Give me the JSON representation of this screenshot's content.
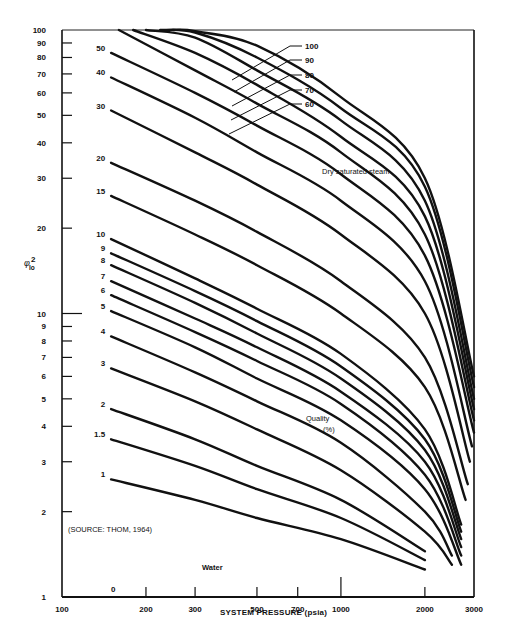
{
  "chart_data": {
    "type": "line",
    "title": "",
    "xlabel": "SYSTEM PRESSURE (psia)",
    "ylabel": "φ²_lo",
    "xscale": "log",
    "yscale": "log",
    "xlim": [
      100,
      3000
    ],
    "ylim": [
      1,
      100
    ],
    "grid": false,
    "x_ticks": [
      100,
      200,
      300,
      500,
      700,
      1000,
      2000,
      3000
    ],
    "x_tick_labels": [
      "100",
      "200",
      "300",
      "500",
      "700",
      "1000",
      "2000",
      "3000"
    ],
    "y_ticks": [
      1,
      2,
      3,
      4,
      5,
      6,
      7,
      8,
      9,
      10,
      20,
      30,
      40,
      50,
      60,
      70,
      80,
      90,
      100
    ],
    "y_tick_labels": [
      "1",
      "2",
      "3",
      "4",
      "5",
      "6",
      "7",
      "8",
      "9",
      "10",
      "20",
      "30",
      "40",
      "50",
      "60",
      "70",
      "80",
      "90",
      "100"
    ],
    "legend_title": "Quality (%)",
    "series": [
      {
        "name": "0",
        "x": [
          150,
          3000
        ],
        "y": [
          1,
          1
        ]
      },
      {
        "name": "1",
        "x": [
          150,
          300,
          500,
          1000,
          2000
        ],
        "y": [
          2.6,
          2.2,
          1.9,
          1.6,
          1.25
        ]
      },
      {
        "name": "1.5",
        "x": [
          150,
          300,
          500,
          1000,
          2000
        ],
        "y": [
          3.6,
          2.9,
          2.4,
          1.9,
          1.35
        ]
      },
      {
        "name": "2",
        "x": [
          150,
          300,
          500,
          1000,
          2000
        ],
        "y": [
          4.6,
          3.6,
          2.9,
          2.2,
          1.45
        ]
      },
      {
        "name": "3",
        "x": [
          150,
          300,
          500,
          1000,
          2000,
          2500
        ],
        "y": [
          6.4,
          4.9,
          3.9,
          2.8,
          1.7,
          1.3
        ]
      },
      {
        "name": "4",
        "x": [
          150,
          300,
          500,
          1000,
          2000,
          2500
        ],
        "y": [
          8.3,
          6.2,
          4.9,
          3.5,
          2.0,
          1.4
        ]
      },
      {
        "name": "5",
        "x": [
          150,
          300,
          500,
          1000,
          2000,
          2700
        ],
        "y": [
          10.2,
          7.6,
          5.9,
          4.2,
          2.4,
          1.3
        ]
      },
      {
        "name": "6",
        "x": [
          150,
          300,
          500,
          1000,
          2000,
          2700
        ],
        "y": [
          11.6,
          8.6,
          6.8,
          4.8,
          2.7,
          1.4
        ]
      },
      {
        "name": "7",
        "x": [
          150,
          300,
          500,
          1000,
          2000,
          2700
        ],
        "y": [
          13.0,
          9.6,
          7.6,
          5.3,
          3.0,
          1.5
        ]
      },
      {
        "name": "8",
        "x": [
          150,
          300,
          500,
          1000,
          2000,
          2700
        ],
        "y": [
          14.8,
          10.9,
          8.5,
          5.9,
          3.3,
          1.6
        ]
      },
      {
        "name": "9",
        "x": [
          150,
          300,
          500,
          1000,
          2000,
          2700
        ],
        "y": [
          16.3,
          12.0,
          9.4,
          6.5,
          3.6,
          1.7
        ]
      },
      {
        "name": "10",
        "x": [
          150,
          300,
          500,
          1000,
          2000,
          2700
        ],
        "y": [
          18.3,
          13.3,
          10.4,
          7.2,
          3.9,
          1.8
        ]
      },
      {
        "name": "15",
        "x": [
          150,
          300,
          500,
          1000,
          2000,
          2800
        ],
        "y": [
          26,
          19,
          14.8,
          10,
          5.5,
          2.2
        ]
      },
      {
        "name": "20",
        "x": [
          150,
          300,
          500,
          1000,
          2000,
          2850
        ],
        "y": [
          34,
          25,
          19.4,
          13,
          7,
          2.5
        ]
      },
      {
        "name": "30",
        "x": [
          150,
          300,
          500,
          1000,
          2000,
          2900
        ],
        "y": [
          52,
          37,
          28.5,
          19,
          10,
          3.0
        ]
      },
      {
        "name": "40",
        "x": [
          150,
          300,
          500,
          1000,
          2000,
          2950
        ],
        "y": [
          68,
          49,
          37,
          25,
          13,
          3.4
        ]
      },
      {
        "name": "50",
        "x": [
          150,
          300,
          500,
          1000,
          2000,
          3000
        ],
        "y": [
          83,
          60,
          46,
          31,
          16,
          3.8
        ]
      },
      {
        "name": "60",
        "x": [
          160,
          300,
          500,
          1000,
          2000,
          3000
        ],
        "y": [
          100,
          72,
          55,
          37,
          19,
          4.2
        ]
      },
      {
        "name": "70",
        "x": [
          180,
          300,
          500,
          1000,
          2000,
          3000
        ],
        "y": [
          100,
          83,
          64,
          42,
          22,
          4.6
        ]
      },
      {
        "name": "80",
        "x": [
          200,
          300,
          500,
          1000,
          2000,
          3000
        ],
        "y": [
          100,
          94,
          72,
          48,
          25,
          5.0
        ]
      },
      {
        "name": "90",
        "x": [
          225,
          300,
          500,
          1000,
          2000,
          3000
        ],
        "y": [
          100,
          98,
          80,
          53,
          28,
          5.5
        ]
      },
      {
        "name": "100",
        "x": [
          250,
          300,
          500,
          1000,
          2000,
          3000
        ],
        "y": [
          100,
          99,
          88,
          58,
          30,
          6.0
        ]
      }
    ],
    "annotations": [
      {
        "text": "Dry saturated steam"
      },
      {
        "text": "Quality"
      },
      {
        "text": "(%)"
      },
      {
        "text": "(SOURCE:  THOM, 1964)"
      },
      {
        "text": "Water"
      }
    ]
  },
  "labels": {
    "xlabel": "SYSTEM PRESSURE (psia)",
    "ylabel_main": "φ",
    "ylabel_sup": "2",
    "ylabel_sub": "lo",
    "dry_steam": "Dry saturated steam",
    "quality": "Quality",
    "quality_unit": "(%)",
    "source": "(SOURCE:  THOM, 1964)",
    "water": "Water"
  }
}
